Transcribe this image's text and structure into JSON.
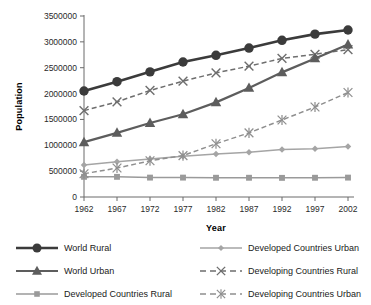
{
  "chart_data": {
    "type": "line",
    "title": "",
    "xlabel": "Year",
    "ylabel": "Population",
    "categories": [
      1962,
      1967,
      1972,
      1977,
      1982,
      1987,
      1992,
      1997,
      2002
    ],
    "xtick_labels": [
      "1962",
      "1967",
      "1972",
      "1977",
      "1982",
      "1987",
      "1992",
      "1997",
      "2002"
    ],
    "ytick_labels": [
      "0",
      "500000",
      "1000000",
      "1500000",
      "2000000",
      "2500000",
      "3000000",
      "3500000"
    ],
    "ytick_values": [
      0,
      500000,
      1000000,
      1500000,
      2000000,
      2500000,
      3000000,
      3500000
    ],
    "ylim": [
      0,
      3500000
    ],
    "xlim": [
      1962,
      2002
    ],
    "grid": false,
    "legend_position": "bottom",
    "series": [
      {
        "name": "World Rural",
        "marker": "circle",
        "linestyle": "solid",
        "color": "#3b3b3b",
        "values": [
          2050000,
          2230000,
          2420000,
          2610000,
          2740000,
          2880000,
          3030000,
          3150000,
          3230000
        ]
      },
      {
        "name": "World Urban",
        "marker": "triangle",
        "linestyle": "solid",
        "color": "#5d5d5d",
        "values": [
          1060000,
          1240000,
          1430000,
          1600000,
          1830000,
          2110000,
          2410000,
          2680000,
          2950000
        ]
      },
      {
        "name": "Developed Countries Rural",
        "marker": "square",
        "linestyle": "solid",
        "color": "#9a9a9a",
        "values": [
          390000,
          390000,
          375000,
          375000,
          372000,
          372000,
          370000,
          372000,
          375000
        ]
      },
      {
        "name": "Developed Countries Urban",
        "marker": "diamond",
        "linestyle": "solid",
        "color": "#a5a5a5",
        "values": [
          620000,
          680000,
          735000,
          790000,
          830000,
          865000,
          920000,
          935000,
          975000
        ]
      },
      {
        "name": "Developing Countries Rural",
        "marker": "x",
        "linestyle": "dashed",
        "color": "#6e6e6e",
        "values": [
          1670000,
          1840000,
          2060000,
          2240000,
          2400000,
          2530000,
          2680000,
          2760000,
          2850000
        ]
      },
      {
        "name": "Developing Countries Urban",
        "marker": "asterisk",
        "linestyle": "dashed",
        "color": "#8f8f8f",
        "values": [
          450000,
          560000,
          700000,
          800000,
          1030000,
          1240000,
          1490000,
          1740000,
          2020000
        ]
      }
    ]
  },
  "axes": {
    "y_title": "Population",
    "x_title": "Year"
  },
  "legend": {
    "items": [
      {
        "label": "World Rural",
        "marker": "circle",
        "linestyle": "solid",
        "color": "#3b3b3b"
      },
      {
        "label": "World Urban",
        "marker": "triangle",
        "linestyle": "solid",
        "color": "#5d5d5d"
      },
      {
        "label": "Developed Countries Rural",
        "marker": "square",
        "linestyle": "solid",
        "color": "#9a9a9a"
      },
      {
        "label": "Developed Countries Urban",
        "marker": "diamond",
        "linestyle": "solid",
        "color": "#a5a5a5"
      },
      {
        "label": "Developing Countries Rural",
        "marker": "x",
        "linestyle": "dashed",
        "color": "#6e6e6e"
      },
      {
        "label": "Developing Countries Urban",
        "marker": "asterisk",
        "linestyle": "dashed",
        "color": "#8f8f8f"
      }
    ]
  },
  "colors": {
    "axis": "#6a6a6a",
    "text": "#1a1a1a",
    "background": "#ffffff"
  }
}
